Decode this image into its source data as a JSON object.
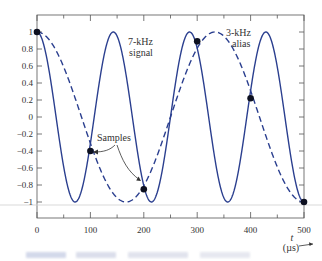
{
  "chart_data": {
    "type": "line",
    "title": "",
    "xlabel": "t (µs)",
    "ylabel": "",
    "xlim": [
      0,
      500
    ],
    "ylim": [
      -1,
      1
    ],
    "x_ticks": [
      0,
      100,
      200,
      300,
      400,
      500
    ],
    "x_minor_ticks": [
      50,
      150,
      250,
      350,
      450
    ],
    "y_ticks": [
      1,
      0.8,
      0.6,
      0.4,
      0.2,
      0,
      -0.2,
      -0.4,
      -0.6,
      -0.8,
      -1
    ],
    "y_tick_labels": [
      "1",
      "0.8",
      "0.6",
      "0.4",
      "0.2",
      "0",
      "−0.2",
      "−0.4",
      "−0.6",
      "−0.8",
      "−1"
    ],
    "grid": false,
    "series": [
      {
        "name": "7-kHz signal",
        "style": "solid",
        "frequency_khz": 7,
        "function": "cos(2*pi*7000*t)"
      },
      {
        "name": "3-kHz alias",
        "style": "dashed",
        "frequency_khz": 3,
        "function": "cos(2*pi*3000*t)"
      }
    ],
    "samples": {
      "name": "Samples",
      "x": [
        0,
        100,
        200,
        300,
        400,
        500
      ],
      "y": [
        1,
        -0.4,
        -0.85,
        0.89,
        0.22,
        -1
      ]
    },
    "annotations": [
      {
        "text": "7-kHz signal",
        "lines": [
          "7-kHz",
          "signal"
        ]
      },
      {
        "text": "3-kHz alias",
        "lines": [
          "3-kHz",
          "alias"
        ]
      },
      {
        "text": "Samples",
        "arrows_to": [
          100,
          200
        ]
      }
    ]
  },
  "labels": {
    "signal_line1": "7-kHz",
    "signal_line2": "signal",
    "alias_line1": "3-kHz",
    "alias_line2": "alias",
    "samples": "Samples",
    "t_axis": "t",
    "t_unit": "(µs)",
    "x_tick_0": "0",
    "x_tick_100": "100",
    "x_tick_200": "200",
    "x_tick_300": "300",
    "x_tick_400": "400",
    "x_tick_500": "500"
  },
  "colors": {
    "curve": "#2b3f8f",
    "sample_dot": "#0d1020",
    "axis": "#444444",
    "text": "#333333",
    "stray_line": "#c8c8c8"
  },
  "caption": {
    "text": " "
  }
}
